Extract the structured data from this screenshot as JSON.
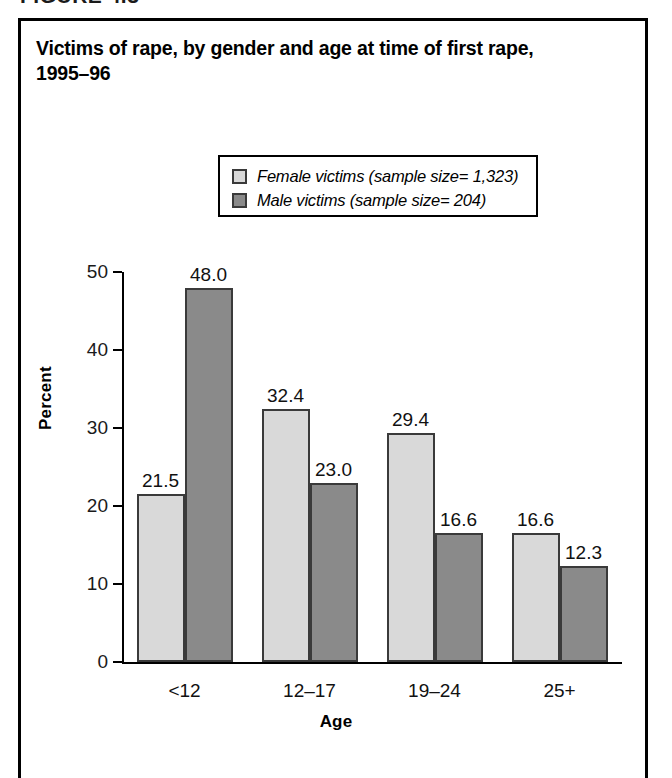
{
  "figure": {
    "label": "FIGURE 4.3"
  },
  "title": {
    "line1": "Victims of rape, by gender and age at time of first rape,",
    "line2": "1995–96"
  },
  "colors": {
    "female_fill": "#d9d9d9",
    "male_fill": "#8a8a8a",
    "bar_edge": "#3a3a3a",
    "axis": "#000000",
    "border": "#000000",
    "background": "#ffffff"
  },
  "chart_data": {
    "type": "bar",
    "title": "Victims of rape, by gender and age at time of first rape, 1995–96",
    "xlabel": "Age",
    "ylabel": "Percent",
    "ylim": [
      0,
      50
    ],
    "yticks": [
      0,
      10,
      20,
      30,
      40,
      50
    ],
    "ytick_labels": [
      "0",
      "10",
      "20",
      "30",
      "40",
      "50"
    ],
    "categories": [
      "<12",
      "12–17",
      "19–24",
      "25+"
    ],
    "grid": false,
    "legend_position": "upper-center",
    "series": [
      {
        "name": "Female victims (sample size= 1,323)",
        "short_name": "Female victims",
        "sample_size": "1,323",
        "color": "#d9d9d9",
        "values": [
          21.5,
          32.4,
          29.4,
          16.6
        ],
        "value_labels": [
          "21.5",
          "32.4",
          "29.4",
          "16.6"
        ]
      },
      {
        "name": "Male victims (sample size= 204)",
        "short_name": "Male victims",
        "sample_size": "204",
        "color": "#8a8a8a",
        "values": [
          48.0,
          23.0,
          16.6,
          12.3
        ],
        "value_labels": [
          "48.0",
          "23.0",
          "16.6",
          "12.3"
        ]
      }
    ]
  }
}
